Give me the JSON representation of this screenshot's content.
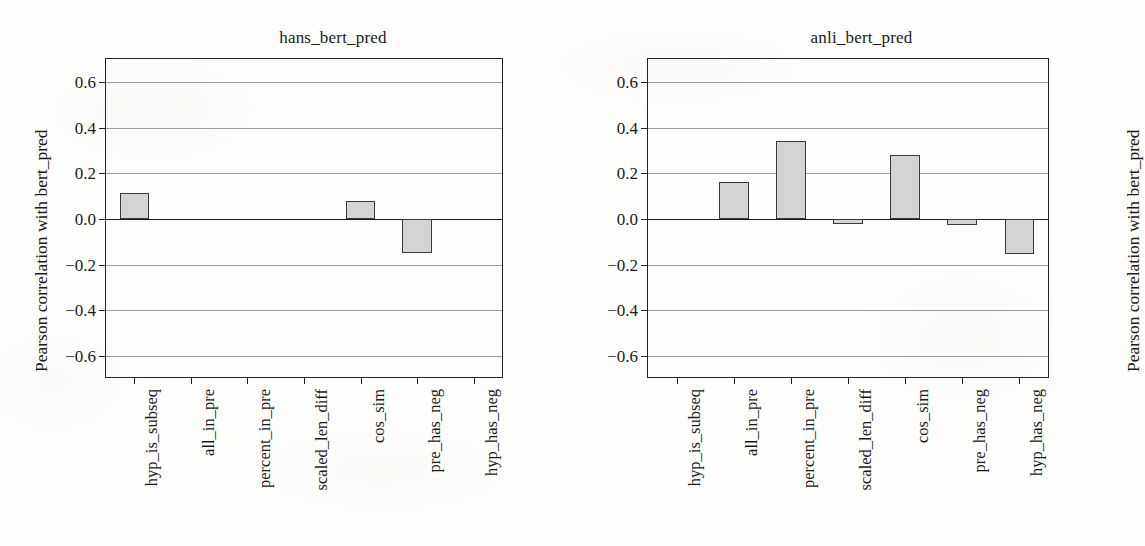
{
  "figure": {
    "ylabel": "Pearson correlation with bert_pred",
    "yticks": [
      "0.6",
      "0.4",
      "0.2",
      "0.0",
      "−0.2",
      "−0.4",
      "−0.6"
    ],
    "ylim": [
      -0.7,
      0.7
    ],
    "bar_fill": "#d4d4d4",
    "bar_edge": "#3a3a3a",
    "grid_color": "#9c9c9c",
    "axis_color": "#222222"
  },
  "chart_data": [
    {
      "type": "bar",
      "title": "hans_bert_pred",
      "xlabel": "",
      "ylabel": "Pearson correlation with bert_pred",
      "ylim": [
        -0.7,
        0.7
      ],
      "yticks": [
        0.6,
        0.4,
        0.2,
        0.0,
        -0.2,
        -0.4,
        -0.6
      ],
      "grid": true,
      "legend": "none",
      "categories": [
        "hyp_is_subseq",
        "all_in_pre",
        "percent_in_pre",
        "scaled_len_diff",
        "cos_sim",
        "pre_has_neg",
        "hyp_has_neg"
      ],
      "values": [
        0.115,
        0.0,
        0.0,
        0.0,
        0.08,
        -0.15,
        0.0
      ]
    },
    {
      "type": "bar",
      "title": "anli_bert_pred",
      "xlabel": "",
      "ylabel": "Pearson correlation with bert_pred",
      "ylim": [
        -0.7,
        0.7
      ],
      "yticks": [
        0.6,
        0.4,
        0.2,
        0.0,
        -0.2,
        -0.4,
        -0.6
      ],
      "grid": true,
      "legend": "none",
      "categories": [
        "hyp_is_subseq",
        "all_in_pre",
        "percent_in_pre",
        "scaled_len_diff",
        "cos_sim",
        "pre_has_neg",
        "hyp_has_neg"
      ],
      "values": [
        0.0,
        0.163,
        0.341,
        -0.021,
        0.282,
        -0.026,
        -0.155
      ]
    }
  ]
}
